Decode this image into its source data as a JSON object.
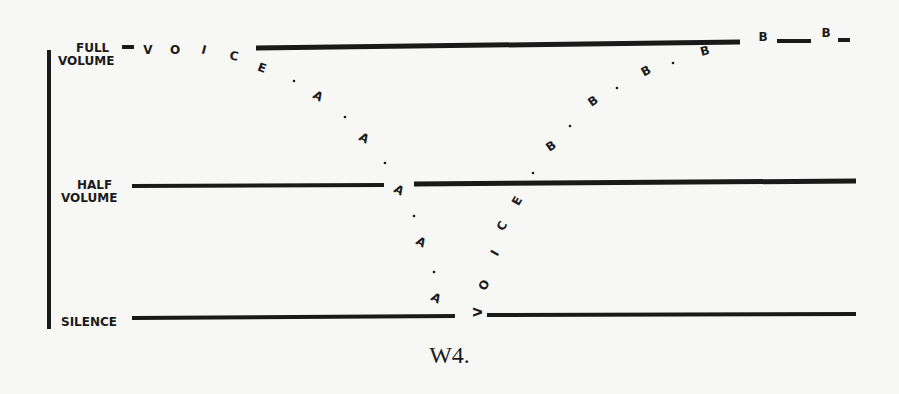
{
  "figure": {
    "caption": "W4.",
    "ink_color": "#1a1a1a",
    "background_color": "#f7f7f5"
  },
  "levels": [
    {
      "id": "full",
      "label_line1": "FULL",
      "label_line2": "VOLUME",
      "y": 47
    },
    {
      "id": "half",
      "label_line1": "HALF",
      "label_line2": "VOLUME",
      "y": 183
    },
    {
      "id": "silence",
      "label_line1": "SILENCE",
      "label_line2": "",
      "y": 320
    }
  ],
  "voice_a_path": {
    "description": "Voice word at full volume, letters fade through A A A A down to silence",
    "letters": [
      {
        "char": "V",
        "x": 148,
        "y": 54,
        "rot": 0
      },
      {
        "char": "O",
        "x": 175,
        "y": 54,
        "rot": 0
      },
      {
        "char": "I",
        "x": 204,
        "y": 54,
        "rot": 15
      },
      {
        "char": "C",
        "x": 234,
        "y": 60,
        "rot": 10
      },
      {
        "char": "E",
        "x": 262,
        "y": 72,
        "rot": 20
      },
      {
        "char": "A",
        "x": 318,
        "y": 100,
        "rot": 30
      },
      {
        "char": "A",
        "x": 364,
        "y": 142,
        "rot": 30
      },
      {
        "char": "A",
        "x": 399,
        "y": 194,
        "rot": 30
      },
      {
        "char": "A",
        "x": 421,
        "y": 246,
        "rot": 30
      },
      {
        "char": "A",
        "x": 436,
        "y": 302,
        "rot": 30
      }
    ],
    "dots": [
      {
        "x": 294,
        "y": 81
      },
      {
        "x": 345,
        "y": 117
      },
      {
        "x": 385,
        "y": 163
      },
      {
        "x": 414,
        "y": 216
      },
      {
        "x": 434,
        "y": 272
      }
    ]
  },
  "voice_b_path": {
    "description": "Voice rising from silence, letters go V O I C E then B B B B B up to full volume",
    "letters": [
      {
        "char": "V",
        "x": 478,
        "y": 316,
        "rot": -90
      },
      {
        "char": "O",
        "x": 484,
        "y": 289,
        "rot": -60
      },
      {
        "char": "I",
        "x": 495,
        "y": 257,
        "rot": -60
      },
      {
        "char": "C",
        "x": 502,
        "y": 230,
        "rot": -60
      },
      {
        "char": "E",
        "x": 517,
        "y": 205,
        "rot": -60
      },
      {
        "char": "B",
        "x": 551,
        "y": 150,
        "rot": -35
      },
      {
        "char": "B",
        "x": 593,
        "y": 105,
        "rot": -35
      },
      {
        "char": "B",
        "x": 646,
        "y": 75,
        "rot": -30
      },
      {
        "char": "B",
        "x": 705,
        "y": 55,
        "rot": -15
      },
      {
        "char": "B",
        "x": 763,
        "y": 41,
        "rot": 0
      },
      {
        "char": "B",
        "x": 826,
        "y": 37,
        "rot": 0
      }
    ],
    "dots": [
      {
        "x": 533,
        "y": 173
      },
      {
        "x": 570,
        "y": 126
      },
      {
        "x": 617,
        "y": 88
      },
      {
        "x": 673,
        "y": 63
      }
    ]
  },
  "segments": [
    {
      "name": "axis-vertical",
      "x1": 49,
      "y1": 50,
      "x2": 49,
      "y2": 329,
      "w": 4
    },
    {
      "name": "full-stub",
      "x1": 122,
      "y1": 47,
      "x2": 134,
      "y2": 47,
      "w": 4
    },
    {
      "name": "full-line",
      "x1": 256,
      "y1": 48,
      "x2": 740,
      "y2": 42,
      "w": 5
    },
    {
      "name": "full-dash-1",
      "x1": 777,
      "y1": 41,
      "x2": 811,
      "y2": 41,
      "w": 4
    },
    {
      "name": "full-dash-2",
      "x1": 838,
      "y1": 40,
      "x2": 850,
      "y2": 40,
      "w": 4
    },
    {
      "name": "half-line-left",
      "x1": 132,
      "y1": 186,
      "x2": 384,
      "y2": 185,
      "w": 4
    },
    {
      "name": "half-line-right",
      "x1": 414,
      "y1": 184,
      "x2": 856,
      "y2": 181,
      "w": 5
    },
    {
      "name": "silence-line-left",
      "x1": 132,
      "y1": 318,
      "x2": 455,
      "y2": 316,
      "w": 4
    },
    {
      "name": "silence-line-right",
      "x1": 487,
      "y1": 315,
      "x2": 856,
      "y2": 314,
      "w": 4
    }
  ]
}
